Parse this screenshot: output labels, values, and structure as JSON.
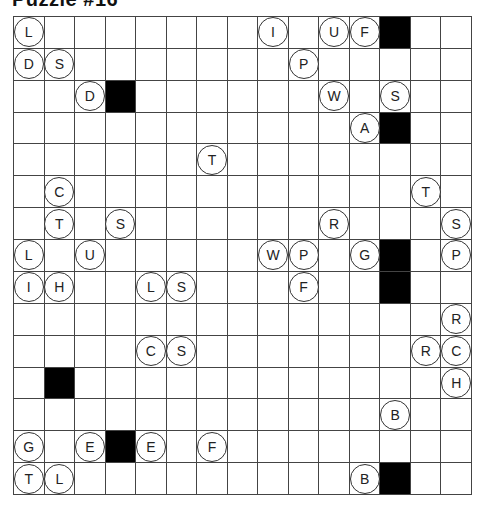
{
  "puzzle": {
    "title": "Puzzle #16",
    "rows": 15,
    "cols": 15,
    "black_cells": [
      [
        0,
        12
      ],
      [
        2,
        3
      ],
      [
        3,
        12
      ],
      [
        7,
        12
      ],
      [
        8,
        12
      ],
      [
        11,
        1
      ],
      [
        13,
        3
      ],
      [
        14,
        12
      ]
    ],
    "circled_letters": [
      {
        "row": 0,
        "col": 0,
        "letter": "L"
      },
      {
        "row": 0,
        "col": 8,
        "letter": "I"
      },
      {
        "row": 0,
        "col": 10,
        "letter": "U"
      },
      {
        "row": 0,
        "col": 11,
        "letter": "F"
      },
      {
        "row": 1,
        "col": 0,
        "letter": "D"
      },
      {
        "row": 1,
        "col": 1,
        "letter": "S"
      },
      {
        "row": 1,
        "col": 9,
        "letter": "P"
      },
      {
        "row": 2,
        "col": 2,
        "letter": "D"
      },
      {
        "row": 2,
        "col": 10,
        "letter": "W"
      },
      {
        "row": 2,
        "col": 12,
        "letter": "S"
      },
      {
        "row": 3,
        "col": 11,
        "letter": "A"
      },
      {
        "row": 4,
        "col": 6,
        "letter": "T"
      },
      {
        "row": 5,
        "col": 1,
        "letter": "C"
      },
      {
        "row": 5,
        "col": 13,
        "letter": "T"
      },
      {
        "row": 6,
        "col": 1,
        "letter": "T"
      },
      {
        "row": 6,
        "col": 3,
        "letter": "S"
      },
      {
        "row": 6,
        "col": 10,
        "letter": "R"
      },
      {
        "row": 6,
        "col": 14,
        "letter": "S"
      },
      {
        "row": 7,
        "col": 0,
        "letter": "L"
      },
      {
        "row": 7,
        "col": 2,
        "letter": "U"
      },
      {
        "row": 7,
        "col": 8,
        "letter": "W"
      },
      {
        "row": 7,
        "col": 9,
        "letter": "P"
      },
      {
        "row": 7,
        "col": 11,
        "letter": "G"
      },
      {
        "row": 7,
        "col": 14,
        "letter": "P"
      },
      {
        "row": 8,
        "col": 0,
        "letter": "I"
      },
      {
        "row": 8,
        "col": 1,
        "letter": "H"
      },
      {
        "row": 8,
        "col": 4,
        "letter": "L"
      },
      {
        "row": 8,
        "col": 5,
        "letter": "S"
      },
      {
        "row": 8,
        "col": 9,
        "letter": "F"
      },
      {
        "row": 9,
        "col": 14,
        "letter": "R"
      },
      {
        "row": 10,
        "col": 4,
        "letter": "C"
      },
      {
        "row": 10,
        "col": 5,
        "letter": "S"
      },
      {
        "row": 10,
        "col": 13,
        "letter": "R"
      },
      {
        "row": 10,
        "col": 14,
        "letter": "C"
      },
      {
        "row": 11,
        "col": 14,
        "letter": "H"
      },
      {
        "row": 12,
        "col": 12,
        "letter": "B"
      },
      {
        "row": 13,
        "col": 0,
        "letter": "G"
      },
      {
        "row": 13,
        "col": 2,
        "letter": "E"
      },
      {
        "row": 13,
        "col": 4,
        "letter": "E"
      },
      {
        "row": 13,
        "col": 6,
        "letter": "F"
      },
      {
        "row": 14,
        "col": 0,
        "letter": "T"
      },
      {
        "row": 14,
        "col": 1,
        "letter": "L"
      },
      {
        "row": 14,
        "col": 11,
        "letter": "B"
      }
    ]
  }
}
